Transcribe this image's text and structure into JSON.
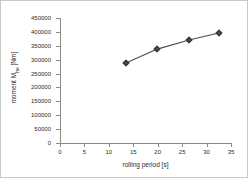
{
  "chart_data": {
    "type": "line",
    "title": "",
    "xlabel": "rolling period [s]",
    "ylabel_main": "moment M",
    "ylabel_sub": "he",
    "ylabel_unit": " [Nm]",
    "ylabel_full": "moment Mhe [Nm]",
    "xlim": [
      0,
      35
    ],
    "ylim": [
      0,
      450000
    ],
    "xticks": [
      0,
      5,
      10,
      15,
      20,
      25,
      30,
      35
    ],
    "xtick_labels": [
      "0",
      "5",
      "10",
      "15",
      "20",
      "25",
      "30",
      "35"
    ],
    "yticks": [
      0,
      50000,
      100000,
      150000,
      200000,
      250000,
      300000,
      350000,
      400000,
      450000
    ],
    "ytick_labels": [
      "0",
      "50000",
      "100000",
      "150000",
      "200000",
      "250000",
      "300000",
      "350000",
      "400000",
      "450000"
    ],
    "grid": false,
    "legend": false,
    "series": [
      {
        "name": "moment",
        "marker": "diamond",
        "color": "#4a4a4a",
        "x": [
          13.5,
          19.9,
          26.4,
          32.5
        ],
        "values": [
          288000,
          338000,
          371000,
          396000
        ]
      }
    ]
  }
}
